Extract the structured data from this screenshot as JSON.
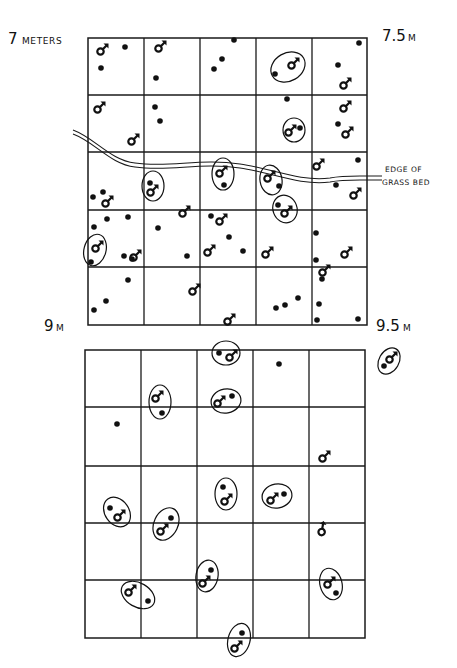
{
  "figure": {
    "width": 457,
    "height": 668,
    "colors": {
      "ink": "#111111",
      "background": "#ffffff"
    }
  },
  "labels": {
    "top_left": {
      "number": "7",
      "unit": "METERS"
    },
    "top_right": {
      "number": "7.5",
      "unit": "M"
    },
    "bottom_left": {
      "number": "9",
      "unit": "M"
    },
    "bottom_right": {
      "number": "9.5",
      "unit": "M"
    },
    "edge_line1": "EDGE OF",
    "edge_line2": "GRASS BED"
  },
  "legend_symbols": {
    "male": "male-symbol (♂)",
    "female": "filled-dot",
    "pair": "ellipse enclosing a male and female"
  },
  "grids": [
    {
      "id": "upper-grid",
      "x": [
        88,
        144,
        200,
        256,
        312,
        367
      ],
      "y": [
        38,
        95,
        152,
        210,
        267,
        325
      ],
      "females": [
        [
          125,
          47
        ],
        [
          101,
          68
        ],
        [
          156,
          78
        ],
        [
          234,
          40
        ],
        [
          222,
          59
        ],
        [
          214,
          69
        ],
        [
          338,
          65
        ],
        [
          359,
          43
        ],
        [
          155,
          107
        ],
        [
          160,
          121
        ],
        [
          287,
          99
        ],
        [
          338,
          124
        ],
        [
          358,
          160
        ],
        [
          336,
          185
        ],
        [
          93,
          197
        ],
        [
          103,
          192
        ],
        [
          316,
          233
        ],
        [
          316,
          260
        ],
        [
          128,
          217
        ],
        [
          107,
          219
        ],
        [
          94,
          227
        ],
        [
          132,
          259
        ],
        [
          124,
          256
        ],
        [
          158,
          228
        ],
        [
          187,
          256
        ],
        [
          211,
          216
        ],
        [
          229,
          237
        ],
        [
          243,
          251
        ],
        [
          128,
          280
        ],
        [
          106,
          301
        ],
        [
          94,
          310
        ],
        [
          322,
          279
        ],
        [
          319,
          304
        ],
        [
          317,
          320
        ],
        [
          358,
          319
        ],
        [
          298,
          298
        ],
        [
          285,
          305
        ],
        [
          276,
          308
        ]
      ],
      "males": [
        [
          102,
          50,
          0
        ],
        [
          160,
          47,
          0
        ],
        [
          345,
          84,
          0
        ],
        [
          99,
          108,
          0
        ],
        [
          133,
          140,
          0
        ],
        [
          345,
          107,
          0
        ],
        [
          347,
          133,
          0
        ],
        [
          318,
          165,
          0
        ],
        [
          107,
          202,
          0
        ],
        [
          184,
          212,
          0
        ],
        [
          221,
          220,
          0
        ],
        [
          135,
          256,
          0
        ],
        [
          209,
          251,
          0
        ],
        [
          267,
          253,
          0
        ],
        [
          346,
          253,
          0
        ],
        [
          324,
          271,
          0
        ],
        [
          194,
          290,
          0
        ],
        [
          229,
          320,
          0
        ],
        [
          355,
          194,
          0
        ]
      ],
      "pairs": [
        {
          "cx": 288,
          "cy": 67,
          "rx": 18,
          "ry": 14,
          "rot": -30,
          "male": [
            293,
            64
          ],
          "female": [
            275,
            74
          ]
        },
        {
          "cx": 294,
          "cy": 130,
          "rx": 11,
          "ry": 12,
          "rot": 0,
          "male": [
            290,
            131
          ],
          "female": [
            300,
            128
          ]
        },
        {
          "cx": 153,
          "cy": 186,
          "rx": 11,
          "ry": 15,
          "rot": 0,
          "male": [
            152,
            191
          ],
          "female": [
            150,
            183
          ]
        },
        {
          "cx": 223,
          "cy": 174,
          "rx": 11,
          "ry": 16,
          "rot": 0,
          "male": [
            221,
            172
          ],
          "female": [
            224,
            185
          ]
        },
        {
          "cx": 271,
          "cy": 180,
          "rx": 11,
          "ry": 15,
          "rot": -10,
          "male": [
            269,
            177
          ],
          "female": [
            279,
            186
          ]
        },
        {
          "cx": 285,
          "cy": 209,
          "rx": 12,
          "ry": 14,
          "rot": -20,
          "male": [
            286,
            212
          ],
          "female": [
            278,
            205
          ]
        },
        {
          "cx": 95,
          "cy": 250,
          "rx": 11,
          "ry": 16,
          "rot": 15,
          "male": [
            97,
            247
          ],
          "female": [
            91,
            262
          ]
        }
      ]
    },
    {
      "id": "lower-grid",
      "x": [
        85,
        141,
        197,
        253,
        309,
        365
      ],
      "y": [
        350,
        407,
        466,
        523,
        580,
        638
      ],
      "females": [
        [
          117,
          424
        ],
        [
          279,
          364
        ]
      ],
      "males": [
        [
          324,
          457,
          0
        ],
        [
          322,
          530,
          -35
        ]
      ],
      "pairs": [
        {
          "cx": 226,
          "cy": 353,
          "rx": 14,
          "ry": 12,
          "rot": 0,
          "male": [
            231,
            356
          ],
          "female": [
            219,
            353
          ]
        },
        {
          "cx": 389,
          "cy": 361,
          "rx": 10,
          "ry": 14,
          "rot": 30,
          "male": [
            391,
            358
          ],
          "female": [
            384,
            366
          ]
        },
        {
          "cx": 160,
          "cy": 402,
          "rx": 11,
          "ry": 17,
          "rot": 0,
          "male": [
            157,
            397
          ],
          "female": [
            162,
            413
          ]
        },
        {
          "cx": 226,
          "cy": 401,
          "rx": 15,
          "ry": 12,
          "rot": -10,
          "male": [
            219,
            402
          ],
          "female": [
            232,
            396
          ]
        },
        {
          "cx": 226,
          "cy": 494,
          "rx": 11,
          "ry": 16,
          "rot": 0,
          "male": [
            226,
            500
          ],
          "female": [
            223,
            487
          ]
        },
        {
          "cx": 277,
          "cy": 496,
          "rx": 15,
          "ry": 12,
          "rot": -10,
          "male": [
            272,
            499
          ],
          "female": [
            284,
            494
          ]
        },
        {
          "cx": 117,
          "cy": 512,
          "rx": 12,
          "ry": 16,
          "rot": -35,
          "male": [
            119,
            516
          ],
          "female": [
            110,
            508
          ]
        },
        {
          "cx": 166,
          "cy": 524,
          "rx": 12,
          "ry": 17,
          "rot": 25,
          "male": [
            162,
            530
          ],
          "female": [
            171,
            518
          ]
        },
        {
          "cx": 207,
          "cy": 576,
          "rx": 11,
          "ry": 16,
          "rot": 10,
          "male": [
            204,
            582
          ],
          "female": [
            211,
            570
          ]
        },
        {
          "cx": 331,
          "cy": 584,
          "rx": 11,
          "ry": 16,
          "rot": -15,
          "male": [
            329,
            583
          ],
          "female": [
            336,
            593
          ]
        },
        {
          "cx": 138,
          "cy": 595,
          "rx": 18,
          "ry": 12,
          "rot": 30,
          "male": [
            130,
            591
          ],
          "female": [
            148,
            601
          ]
        },
        {
          "cx": 239,
          "cy": 640,
          "rx": 11,
          "ry": 17,
          "rot": 15,
          "male": [
            236,
            647
          ],
          "female": [
            242,
            633
          ]
        }
      ]
    }
  ],
  "grass_edge": {
    "path": "M 73 130 C 95 138, 110 160, 135 163 C 170 168, 200 158, 240 164 C 270 168, 300 182, 330 178 C 340 176, 352 176, 360 176 L 382 176",
    "offset": 4
  }
}
